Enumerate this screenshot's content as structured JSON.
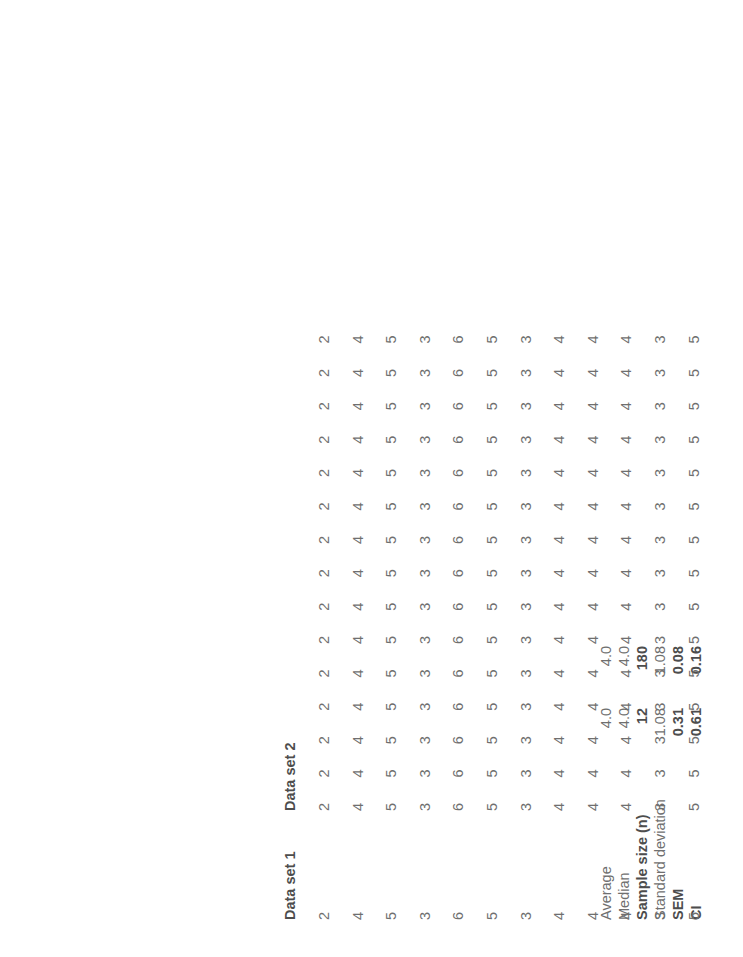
{
  "document": {
    "title": "Data set statistics comparison",
    "text_color": "#6f6f6f",
    "bold_color": "#4d4d4d",
    "background": "#ffffff",
    "orientation": "rotated-90-ccw"
  },
  "summary": {
    "rows": [
      {
        "label": "Average",
        "set1": "4.0",
        "set2": "4.0",
        "bold": false
      },
      {
        "label": "Median",
        "set1": "4.0",
        "set2": "4.0",
        "bold": false
      },
      {
        "label": "Sample size (n)",
        "set1": "12",
        "set2": "180",
        "bold": true
      },
      {
        "label": "Standard deviation",
        "set1": "1.08",
        "set2": "1.08",
        "bold": false
      },
      {
        "label": "SEM",
        "set1": "0.31",
        "set2": "0.08",
        "bold": true
      },
      {
        "label": "CI",
        "set1": "0.61",
        "set2": "0.16",
        "bold": true
      }
    ]
  },
  "data_table": {
    "headers": {
      "set1": "Data set 1",
      "set2": "Data set 2"
    },
    "set1_values": [
      2,
      4,
      5,
      3,
      6,
      5,
      3,
      4,
      4,
      4,
      3,
      5
    ],
    "set2_columns": [
      [
        2,
        4,
        5,
        3,
        6,
        5,
        3,
        4,
        4,
        4,
        3,
        5
      ],
      [
        2,
        4,
        5,
        3,
        6,
        5,
        3,
        4,
        4,
        4,
        3,
        5
      ],
      [
        2,
        4,
        5,
        3,
        6,
        5,
        3,
        4,
        4,
        4,
        3,
        5
      ],
      [
        2,
        4,
        5,
        3,
        6,
        5,
        3,
        4,
        4,
        4,
        3,
        5
      ],
      [
        2,
        4,
        5,
        3,
        6,
        5,
        3,
        4,
        4,
        4,
        3,
        5
      ],
      [
        2,
        4,
        5,
        3,
        6,
        5,
        3,
        4,
        4,
        4,
        3,
        5
      ],
      [
        2,
        4,
        5,
        3,
        6,
        5,
        3,
        4,
        4,
        4,
        3,
        5
      ],
      [
        2,
        4,
        5,
        3,
        6,
        5,
        3,
        4,
        4,
        4,
        3,
        5
      ],
      [
        2,
        4,
        5,
        3,
        6,
        5,
        3,
        4,
        4,
        4,
        3,
        5
      ],
      [
        2,
        4,
        5,
        3,
        6,
        5,
        3,
        4,
        4,
        4,
        3,
        5
      ],
      [
        2,
        4,
        5,
        3,
        6,
        5,
        3,
        4,
        4,
        4,
        3,
        5
      ],
      [
        2,
        4,
        5,
        3,
        6,
        5,
        3,
        4,
        4,
        4,
        3,
        5
      ],
      [
        2,
        4,
        5,
        3,
        6,
        5,
        3,
        4,
        4,
        4,
        3,
        5
      ],
      [
        2,
        4,
        5,
        3,
        6,
        5,
        3,
        4,
        4,
        4,
        3,
        5
      ],
      [
        2,
        4,
        5,
        3,
        6,
        5,
        3,
        4,
        4,
        4,
        3,
        5
      ]
    ]
  }
}
